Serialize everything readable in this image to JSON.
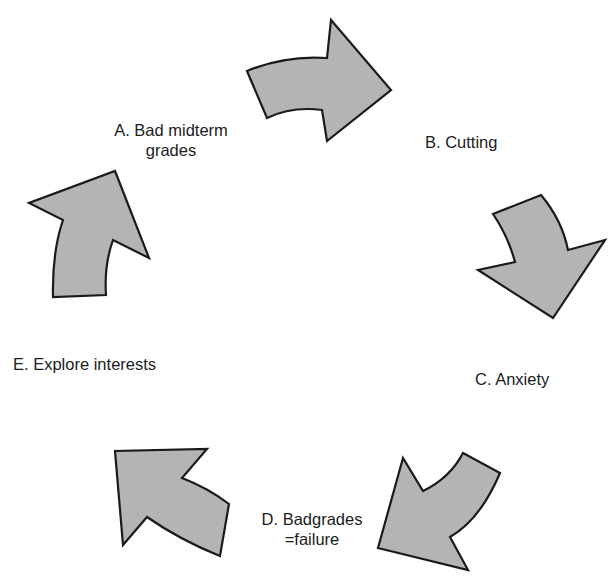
{
  "diagram": {
    "type": "cycle",
    "fill_color": "#b4b4b4",
    "stroke_color": "#1a1a1a",
    "nodes": [
      {
        "id": "A",
        "label": "A. Bad midterm grades",
        "lines": [
          "A. Bad midterm",
          "grades"
        ]
      },
      {
        "id": "B",
        "label": "B. Cutting",
        "lines": [
          "B. Cutting"
        ]
      },
      {
        "id": "C",
        "label": "C. Anxiety",
        "lines": [
          "C. Anxiety"
        ]
      },
      {
        "id": "D",
        "label": "D. Badgrades =failure",
        "lines": [
          "D. Badgrades",
          "=failure"
        ]
      },
      {
        "id": "E",
        "label": "E. Explore interests",
        "lines": [
          "E. Explore interests"
        ]
      }
    ],
    "edges": [
      {
        "from": "A",
        "to": "B",
        "icon": "curved-arrow-right-icon"
      },
      {
        "from": "B",
        "to": "C",
        "icon": "curved-arrow-down-icon"
      },
      {
        "from": "C",
        "to": "D",
        "icon": "curved-arrow-down-left-icon"
      },
      {
        "from": "D",
        "to": "E",
        "icon": "curved-arrow-up-left-icon"
      },
      {
        "from": "E",
        "to": "A",
        "icon": "curved-arrow-up-icon"
      }
    ]
  }
}
